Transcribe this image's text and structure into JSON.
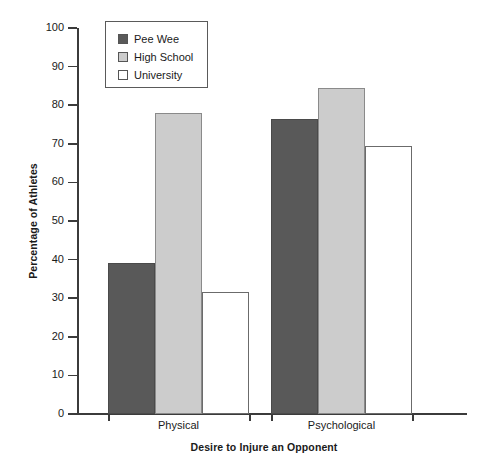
{
  "chart_data": {
    "type": "bar",
    "title": "",
    "xlabel": "Desire to Injure an Opponent",
    "ylabel": "Percentage of Athletes",
    "categories": [
      "Physical",
      "Psychological"
    ],
    "series": [
      {
        "name": "Pee Wee",
        "color": "#595959",
        "values": [
          39.0,
          76.5
        ]
      },
      {
        "name": "High School",
        "color": "#cccccc",
        "values": [
          78.0,
          84.5
        ]
      },
      {
        "name": "University",
        "color": "#ffffff",
        "values": [
          31.5,
          69.5
        ]
      }
    ],
    "ylim": [
      0,
      100
    ],
    "ytick_values": [
      0,
      10,
      20,
      30,
      40,
      50,
      60,
      70,
      80,
      90,
      100
    ],
    "ytick_labels": [
      "0",
      "10",
      "20",
      "30",
      "40",
      "50",
      "60",
      "70",
      "80",
      "90",
      "100"
    ],
    "grid": false,
    "legend_position": "upper-left-inside"
  },
  "legend": {
    "items": [
      {
        "label": "Pee Wee",
        "swatch": "legend-swatch-peewee"
      },
      {
        "label": "High School",
        "swatch": "legend-swatch-highschool"
      },
      {
        "label": "University",
        "swatch": "legend-swatch-university"
      }
    ]
  }
}
